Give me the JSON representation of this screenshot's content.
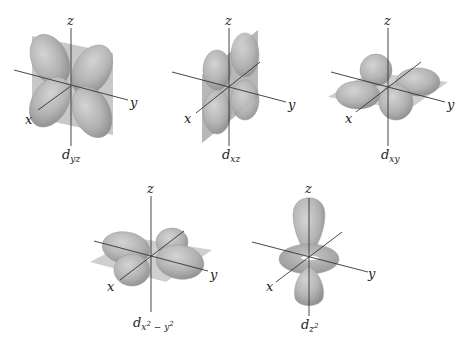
{
  "figure": {
    "colors": {
      "lobe_fill": "#b5b5b5",
      "lobe_shade": "#8f8f8f",
      "plane_fill": "#c4c4c4",
      "axis_line": "#333333",
      "background": "#ffffff"
    },
    "orbitals": [
      {
        "id": "dyz",
        "label_main": "d",
        "label_sub": "yz",
        "axes": {
          "x": "x",
          "y": "y",
          "z": "z"
        },
        "nodal_plane": "yz plane (vertical)",
        "lobes": 4
      },
      {
        "id": "dxz",
        "label_main": "d",
        "label_sub": "xz",
        "axes": {
          "x": "x",
          "y": "y",
          "z": "z"
        },
        "nodal_plane": "xz plane (vertical)",
        "lobes": 4
      },
      {
        "id": "dxy",
        "label_main": "d",
        "label_sub": "xy",
        "axes": {
          "x": "x",
          "y": "y",
          "z": "z"
        },
        "nodal_plane": "xy plane (horizontal)",
        "lobes": 4
      },
      {
        "id": "dx2-y2",
        "label_main": "d",
        "label_sub": "x",
        "label_sup1": "2",
        "label_mid": " − y",
        "label_sup2": "2",
        "axes": {
          "x": "x",
          "y": "y",
          "z": "z"
        },
        "nodal_plane": "xy plane (horizontal)",
        "lobes": 4
      },
      {
        "id": "dz2",
        "label_main": "d",
        "label_sub": "z",
        "label_sup1": "2",
        "axes": {
          "x": "x",
          "y": "y",
          "z": "z"
        },
        "nodal_plane": "none",
        "lobes": 2,
        "torus": true
      }
    ]
  }
}
